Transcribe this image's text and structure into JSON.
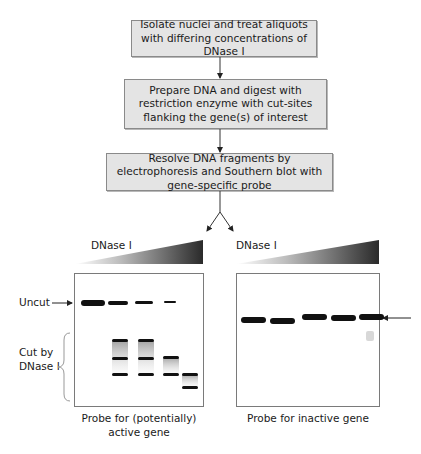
{
  "flow": {
    "steps": [
      {
        "text": "Isolate nuclei and treat aliquots with differing concentrations of DNase I"
      },
      {
        "text": "Prepare DNA and digest with restriction enzyme with cut-sites flanking the gene(s) of interest"
      },
      {
        "text": "Resolve DNA fragments by electrophoresis and Southern blot with gene-specific probe"
      }
    ]
  },
  "panels": {
    "left": {
      "gradient_label": "DNase I",
      "uncut_label": "Uncut",
      "cut_label_line1": "Cut by",
      "cut_label_line2": "DNase I",
      "caption_line1": "Probe for (potentially)",
      "caption_line2": "active gene",
      "lanes": 5
    },
    "right": {
      "gradient_label": "DNase I",
      "caption": "Probe for inactive gene",
      "lanes": 5
    }
  },
  "colors": {
    "box_fill": "#e4e4e4",
    "box_border": "#8a8a8a",
    "band": "#111111",
    "gradient_light": "#ffffff",
    "gradient_dark": "#2a2a2a"
  }
}
